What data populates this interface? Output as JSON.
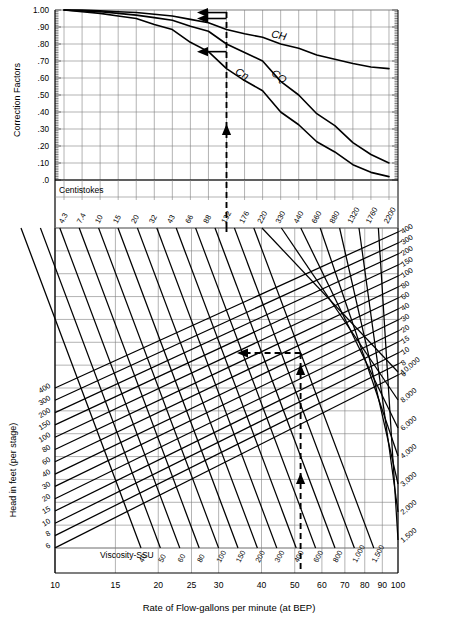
{
  "figure": {
    "xlabel": "Rate of Flow-gallons per minute (at BEP)",
    "ylabel_top": "Correction Factors",
    "ylabel_bottom": "Head in feet (per stage)",
    "label_centistokes": "Centistokes",
    "label_viscosity_ssu": "Viscosity-SSU"
  },
  "chart_data": {
    "type": "line",
    "xlabel": "Rate of Flow-gallons per minute (at BEP)",
    "grid": true,
    "legend": "inline-curve-labels",
    "top_panel": {
      "ylabel": "Correction Factors",
      "ylim": [
        0.0,
        1.0
      ],
      "yticks": [
        "1.00",
        ".90",
        ".80",
        ".70",
        ".60",
        ".50",
        ".40",
        ".30",
        ".20",
        ".10",
        ".0"
      ],
      "ytick_values": [
        1.0,
        0.9,
        0.8,
        0.7,
        0.6,
        0.5,
        0.4,
        0.3,
        0.2,
        0.1,
        0.0
      ],
      "xlabel": "Centistokes",
      "xticks": [
        "4.3",
        "7.4",
        "10",
        "15",
        "20",
        "32",
        "43",
        "66",
        "88",
        "132",
        "176",
        "220",
        "330",
        "440",
        "660",
        "880",
        "1320",
        "1760",
        "2200"
      ],
      "series": [
        {
          "name": "CH",
          "label": "CH",
          "x": [
            4.3,
            7.4,
            10,
            15,
            20,
            32,
            43,
            66,
            88,
            132,
            176,
            220,
            330,
            440,
            660,
            880,
            1320,
            1760,
            2200
          ],
          "values": [
            1.0,
            1.0,
            0.995,
            0.99,
            0.985,
            0.975,
            0.965,
            0.945,
            0.925,
            0.885,
            0.86,
            0.84,
            0.8,
            0.775,
            0.735,
            0.71,
            0.685,
            0.665,
            0.655
          ]
        },
        {
          "name": "CQ",
          "label": "CQ",
          "x": [
            4.3,
            7.4,
            10,
            15,
            20,
            32,
            43,
            66,
            88,
            132,
            176,
            220,
            330,
            440,
            660,
            880,
            1320,
            1760,
            2200
          ],
          "values": [
            1.0,
            0.995,
            0.99,
            0.98,
            0.97,
            0.955,
            0.94,
            0.905,
            0.875,
            0.8,
            0.75,
            0.7,
            0.58,
            0.5,
            0.39,
            0.32,
            0.22,
            0.15,
            0.1
          ]
        },
        {
          "name": "Ceta",
          "label": "Cη",
          "x": [
            4.3,
            7.4,
            10,
            15,
            20,
            32,
            43,
            66,
            88,
            132,
            176,
            220,
            330,
            440,
            660,
            880,
            1320,
            1760,
            2200
          ],
          "values": [
            1.0,
            0.99,
            0.98,
            0.965,
            0.95,
            0.915,
            0.885,
            0.81,
            0.755,
            0.655,
            0.585,
            0.525,
            0.4,
            0.325,
            0.225,
            0.165,
            0.09,
            0.045,
            0.02
          ]
        }
      ]
    },
    "bottom_panel": {
      "ylabel": "Head in feet (per stage)",
      "xlabel": "Rate of Flow-gallons per minute (at BEP)",
      "x_scale": "log",
      "xlim": [
        10,
        100
      ],
      "xticks": [
        "10",
        "15",
        "20",
        "25",
        "30",
        "40",
        "50",
        "60",
        "70",
        "80",
        "90",
        "100"
      ],
      "xtick_values": [
        10,
        15,
        20,
        25,
        30,
        40,
        50,
        60,
        70,
        80,
        90,
        100
      ],
      "head_lines_left_labels": [
        "400",
        "300",
        "200",
        "150",
        "100",
        "80",
        "60",
        "40",
        "30",
        "20",
        "15",
        "10",
        "8",
        "6"
      ],
      "head_lines_right_labels": [
        "400",
        "300",
        "200",
        "150",
        "100",
        "80",
        "60",
        "40",
        "30",
        "20",
        "15",
        "10",
        "8",
        "6"
      ],
      "viscosity_ssu_bottom_labels": [
        "40",
        "50",
        "60",
        "80",
        "100",
        "150",
        "200",
        "300",
        "400",
        "600",
        "800",
        "1,000",
        "1,500"
      ],
      "viscosity_ssu_right_labels": [
        "10,000",
        "8,000",
        "6,000",
        "4,000",
        "3,000",
        "2,000",
        "1,500"
      ]
    },
    "construction_path": {
      "description": "Dashed worked-example path: enter at flow on bottom axis, rise to head line, go left to viscosity line, rise into centistokes strip, then left to read CH, CQ and Ceta.",
      "entry_flow_gpm": 52,
      "head_ft_per_stage": 100,
      "centistokes": 132,
      "read_CH": 0.985,
      "read_CQ": 0.95,
      "read_Ceta": 0.755
    }
  },
  "colors": {
    "ink": "#000000",
    "grid": "#808080",
    "background": "#ffffff"
  }
}
